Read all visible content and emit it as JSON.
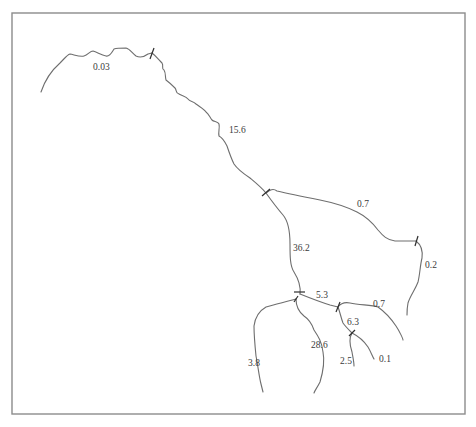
{
  "diagram": {
    "type": "stream-network",
    "colors": {
      "frame": "#8c8c8c",
      "stream": "#6e6e6e",
      "junction_tick": "#2e2e2e",
      "label": "#3a3a3a",
      "background": "#ffffff"
    },
    "segments": [
      {
        "id": "headwater-west",
        "label": "0.03"
      },
      {
        "id": "upper-main",
        "label": "15.6"
      },
      {
        "id": "east-branch",
        "label": "0.7"
      },
      {
        "id": "east-branch-lower",
        "label": "0.2"
      },
      {
        "id": "middle-main",
        "label": "36.2"
      },
      {
        "id": "connector",
        "label": "5.3"
      },
      {
        "id": "southeast-branch",
        "label": "0.7"
      },
      {
        "id": "south-connector",
        "label": "6.3"
      },
      {
        "id": "southwest-branch",
        "label": "3.8"
      },
      {
        "id": "south-main",
        "label": "28.6"
      },
      {
        "id": "south-minor-a",
        "label": "2.5"
      },
      {
        "id": "south-minor-b",
        "label": "0.1"
      }
    ],
    "junction_count": 7
  }
}
